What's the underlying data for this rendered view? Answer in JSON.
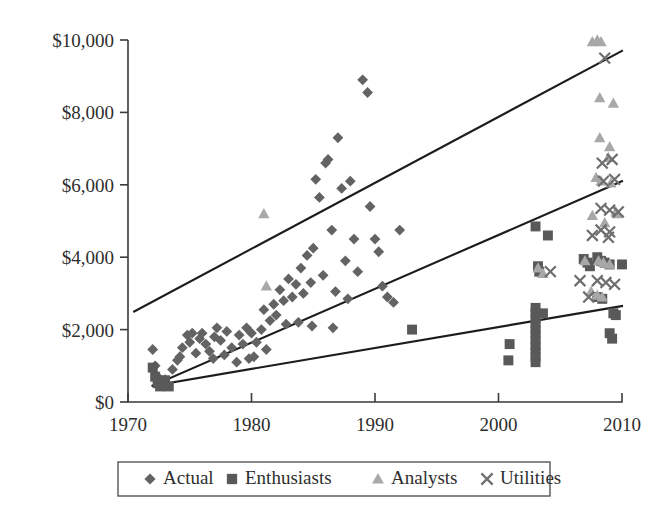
{
  "chart_data": {
    "type": "scatter",
    "title": "",
    "xlabel": "",
    "ylabel": "",
    "xlim": [
      1970,
      2010
    ],
    "ylim": [
      0,
      10000
    ],
    "xticks": [
      1970,
      1980,
      1990,
      2000,
      2010
    ],
    "xtick_labels": [
      "1970",
      "1980",
      "1990",
      "2000",
      "2010"
    ],
    "yticks": [
      0,
      2000,
      4000,
      6000,
      8000,
      10000
    ],
    "ytick_labels": [
      "$0",
      "$2,000",
      "$4,000",
      "$6,000",
      "$8,000",
      "$10,000"
    ],
    "grid": false,
    "legend_position": "bottom",
    "series": [
      {
        "name": "Actual",
        "marker": "diamond",
        "color": "#636363",
        "points": [
          [
            1972.0,
            1450
          ],
          [
            1972.2,
            1000
          ],
          [
            1972.4,
            700
          ],
          [
            1972.5,
            520
          ],
          [
            1973.0,
            620
          ],
          [
            1973.2,
            480
          ],
          [
            1973.6,
            900
          ],
          [
            1974.0,
            1150
          ],
          [
            1974.4,
            1500
          ],
          [
            1974.8,
            1850
          ],
          [
            1975.0,
            1650
          ],
          [
            1975.2,
            1900
          ],
          [
            1975.5,
            1350
          ],
          [
            1975.8,
            1750
          ],
          [
            1976.0,
            1900
          ],
          [
            1976.3,
            1600
          ],
          [
            1976.6,
            1400
          ],
          [
            1977.0,
            1800
          ],
          [
            1977.2,
            2050
          ],
          [
            1977.5,
            1700
          ],
          [
            1977.8,
            1300
          ],
          [
            1978.0,
            1950
          ],
          [
            1978.4,
            1500
          ],
          [
            1978.8,
            1100
          ],
          [
            1979.0,
            1850
          ],
          [
            1979.3,
            1600
          ],
          [
            1979.6,
            2050
          ],
          [
            1980.0,
            1900
          ],
          [
            1980.4,
            1650
          ],
          [
            1980.8,
            2000
          ],
          [
            1981.0,
            2550
          ],
          [
            1981.2,
            1450
          ],
          [
            1981.5,
            2250
          ],
          [
            1981.8,
            2700
          ],
          [
            1982.0,
            2400
          ],
          [
            1982.3,
            3100
          ],
          [
            1982.6,
            2800
          ],
          [
            1983.0,
            3400
          ],
          [
            1983.3,
            2900
          ],
          [
            1983.6,
            3250
          ],
          [
            1984.0,
            3700
          ],
          [
            1984.2,
            3000
          ],
          [
            1984.5,
            4050
          ],
          [
            1984.8,
            3300
          ],
          [
            1985.0,
            4250
          ],
          [
            1985.2,
            6150
          ],
          [
            1985.5,
            5650
          ],
          [
            1985.8,
            3500
          ],
          [
            1986.0,
            6600
          ],
          [
            1986.2,
            6700
          ],
          [
            1986.5,
            4750
          ],
          [
            1986.8,
            3050
          ],
          [
            1987.0,
            7300
          ],
          [
            1987.3,
            5900
          ],
          [
            1987.6,
            3900
          ],
          [
            1987.8,
            2850
          ],
          [
            1988.0,
            6100
          ],
          [
            1988.3,
            4500
          ],
          [
            1988.6,
            3600
          ],
          [
            1989.0,
            8900
          ],
          [
            1989.4,
            8550
          ],
          [
            1989.6,
            5400
          ],
          [
            1990.0,
            4500
          ],
          [
            1990.3,
            4150
          ],
          [
            1990.6,
            3200
          ],
          [
            1991.0,
            2900
          ],
          [
            1991.5,
            2750
          ],
          [
            1992.0,
            4750
          ],
          [
            1983.8,
            2200
          ],
          [
            1984.9,
            2100
          ],
          [
            1986.6,
            2050
          ],
          [
            1982.8,
            2150
          ],
          [
            1980.2,
            1250
          ],
          [
            1979.8,
            1200
          ],
          [
            1976.9,
            1200
          ],
          [
            1974.2,
            1250
          ]
        ]
      },
      {
        "name": "Enthusiasts",
        "marker": "square",
        "color": "#595959",
        "points": [
          [
            1972.0,
            950
          ],
          [
            1972.2,
            700
          ],
          [
            1972.4,
            520
          ],
          [
            1972.6,
            430
          ],
          [
            1973.0,
            600
          ],
          [
            1973.3,
            430
          ],
          [
            1993.0,
            2000
          ],
          [
            2000.8,
            1150
          ],
          [
            2000.9,
            1600
          ],
          [
            2003.0,
            4850
          ],
          [
            2003.2,
            3750
          ],
          [
            2003.3,
            3600
          ],
          [
            2003.0,
            2600
          ],
          [
            2003.0,
            2450
          ],
          [
            2003.0,
            2300
          ],
          [
            2003.0,
            2150
          ],
          [
            2003.0,
            2000
          ],
          [
            2003.0,
            1850
          ],
          [
            2003.0,
            1700
          ],
          [
            2003.0,
            1550
          ],
          [
            2003.0,
            1400
          ],
          [
            2003.0,
            1250
          ],
          [
            2003.0,
            1100
          ],
          [
            2003.6,
            2450
          ],
          [
            2004.0,
            4600
          ],
          [
            2006.9,
            3950
          ],
          [
            2007.2,
            3850
          ],
          [
            2007.4,
            3750
          ],
          [
            2008.0,
            4000
          ],
          [
            2008.3,
            3900
          ],
          [
            2008.6,
            3850
          ],
          [
            2008.0,
            2900
          ],
          [
            2008.4,
            2850
          ],
          [
            2009.0,
            3800
          ],
          [
            2009.3,
            2450
          ],
          [
            2009.5,
            2400
          ],
          [
            2009.0,
            1900
          ],
          [
            2009.2,
            1750
          ],
          [
            2010.0,
            3800
          ]
        ]
      },
      {
        "name": "Analysts",
        "marker": "triangle",
        "color": "#a8a8a8",
        "points": [
          [
            1981.0,
            5200
          ],
          [
            1981.2,
            3200
          ],
          [
            2003.2,
            3700
          ],
          [
            2003.6,
            3550
          ],
          [
            2007.6,
            9950
          ],
          [
            2008.0,
            10000
          ],
          [
            2008.3,
            9950
          ],
          [
            2008.2,
            8400
          ],
          [
            2009.3,
            8250
          ],
          [
            2008.2,
            7300
          ],
          [
            2009.0,
            7050
          ],
          [
            2008.9,
            6750
          ],
          [
            2007.9,
            6200
          ],
          [
            2008.3,
            6100
          ],
          [
            2009.1,
            6050
          ],
          [
            2007.6,
            5150
          ],
          [
            2008.6,
            4950
          ],
          [
            2009.6,
            5200
          ],
          [
            2008.1,
            3900
          ],
          [
            2008.5,
            3850
          ],
          [
            2009.0,
            3800
          ],
          [
            2007.5,
            3050
          ],
          [
            2008.0,
            2950
          ],
          [
            2008.4,
            2900
          ],
          [
            2009.5,
            5250
          ],
          [
            2007.0,
            3900
          ]
        ]
      },
      {
        "name": "Utilities",
        "marker": "cross",
        "color": "#6e6e6e",
        "points": [
          [
            2008.6,
            9500
          ],
          [
            2009.2,
            6700
          ],
          [
            2008.4,
            6600
          ],
          [
            2009.4,
            6150
          ],
          [
            2008.5,
            6100
          ],
          [
            2008.3,
            5350
          ],
          [
            2009.0,
            5300
          ],
          [
            2009.7,
            5250
          ],
          [
            2008.3,
            4750
          ],
          [
            2009.0,
            4700
          ],
          [
            2007.6,
            4600
          ],
          [
            2008.9,
            4550
          ],
          [
            2008.0,
            3350
          ],
          [
            2008.7,
            3300
          ],
          [
            2009.4,
            3250
          ],
          [
            2007.3,
            2900
          ],
          [
            2004.2,
            3600
          ],
          [
            2006.6,
            3350
          ]
        ]
      }
    ],
    "trend_lines": [
      {
        "name": "upper-trend-line",
        "x0": 1970.5,
        "y0": 2500,
        "x1": 2010,
        "y1": 9700
      },
      {
        "name": "middle-trend-line",
        "x0": 1972.0,
        "y0": 450,
        "x1": 2010,
        "y1": 6100
      },
      {
        "name": "lower-trend-line",
        "x0": 1972.0,
        "y0": 450,
        "x1": 2010,
        "y1": 2650
      }
    ],
    "legend": [
      {
        "label": "Actual",
        "marker": "diamond",
        "color": "#636363"
      },
      {
        "label": "Enthusiasts",
        "marker": "square",
        "color": "#595959"
      },
      {
        "label": "Analysts",
        "marker": "triangle",
        "color": "#a8a8a8"
      },
      {
        "label": "Utilities",
        "marker": "cross",
        "color": "#6e6e6e"
      }
    ]
  }
}
